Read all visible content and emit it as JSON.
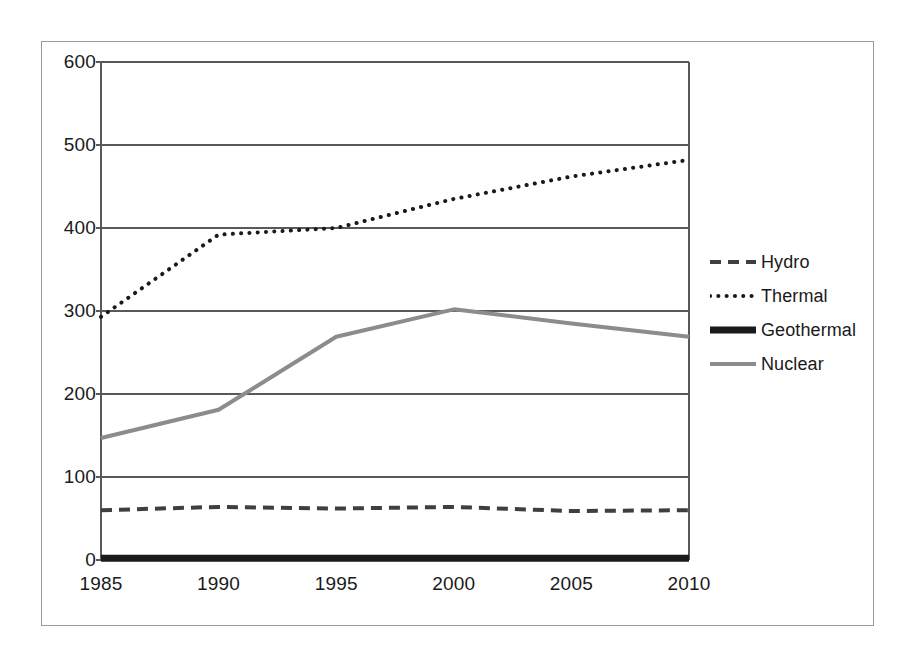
{
  "chart_data": {
    "type": "line",
    "title": "",
    "subtitle": "",
    "xlabel": "",
    "ylabel": "",
    "x": [
      1985,
      1990,
      1995,
      2000,
      2005,
      2010
    ],
    "categories": [
      "1985",
      "1990",
      "1995",
      "2000",
      "2005",
      "2010"
    ],
    "xlim": [
      1985,
      2010
    ],
    "ylim": [
      0,
      600
    ],
    "y_ticks": [
      0,
      100,
      200,
      300,
      400,
      500,
      600
    ],
    "y_tick_labels": [
      "0",
      "100",
      "200",
      "300",
      "400",
      "500",
      "600"
    ],
    "x_ticks": [
      1985,
      1990,
      1995,
      2000,
      2005,
      2010
    ],
    "x_tick_labels": [
      "1985",
      "1990",
      "1995",
      "2000",
      "2005",
      "2010"
    ],
    "grid": "horizontal",
    "legend_position": "right",
    "series": [
      {
        "name": "Hydro",
        "values": [
          60,
          64,
          62,
          64,
          59,
          60
        ],
        "color": "#3f3f3f",
        "style": "dashed",
        "width": 4
      },
      {
        "name": "Thermal",
        "values": [
          293,
          392,
          400,
          435,
          462,
          482
        ],
        "color": "#1a1a1a",
        "style": "dotted",
        "width": 4
      },
      {
        "name": "Geothermal",
        "values": [
          2,
          2,
          2,
          2,
          2,
          2
        ],
        "color": "#1a1a1a",
        "style": "solid",
        "width": 7
      },
      {
        "name": "Nuclear",
        "values": [
          147,
          181,
          269,
          302,
          285,
          269
        ],
        "color": "#8c8c8c",
        "style": "solid",
        "width": 4
      }
    ]
  },
  "legend": {
    "items": [
      {
        "label": "Hydro"
      },
      {
        "label": "Thermal"
      },
      {
        "label": "Geothermal"
      },
      {
        "label": "Nuclear"
      }
    ]
  },
  "axes": {
    "y_labels": [
      "600",
      "500",
      "400",
      "300",
      "200",
      "100",
      "0"
    ],
    "x_labels": [
      "1985",
      "1990",
      "1995",
      "2000",
      "2005",
      "2010"
    ]
  },
  "colors": {
    "frame": "#9a9a9a",
    "gridline": "#595959",
    "plot_border": "#595959",
    "text": "#1a1a1a",
    "background": "#ffffff"
  }
}
